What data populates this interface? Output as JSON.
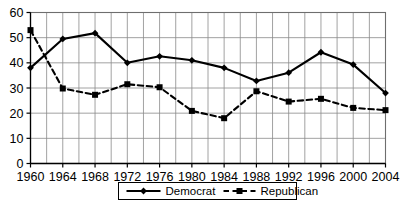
{
  "chart_data": {
    "type": "line",
    "title": "",
    "subtitle": "",
    "xlabel": "",
    "ylabel": "",
    "categories": [
      "1960",
      "1964",
      "1968",
      "1972",
      "1976",
      "1980",
      "1984",
      "1988",
      "1992",
      "1996",
      "2000",
      "2004"
    ],
    "x": [
      1960,
      1964,
      1968,
      1972,
      1976,
      1980,
      1984,
      1988,
      1992,
      1996,
      2000,
      2004
    ],
    "xlim": [
      1960,
      2004
    ],
    "ylim": [
      0,
      60
    ],
    "ytick_labels": [
      "60",
      "50",
      "40",
      "30",
      "20",
      "10",
      "0"
    ],
    "ytick_values": [
      60,
      50,
      40,
      30,
      20,
      10,
      0
    ],
    "xtick_labels": [
      "1960",
      "1964",
      "1968",
      "1972",
      "1976",
      "1980",
      "1984",
      "1988",
      "1992",
      "1996",
      "2000",
      "2004"
    ],
    "grid": true,
    "grid_x_step": 2,
    "grid_y_step": 10,
    "legend_position": "bottom",
    "series": [
      {
        "name": "Democrat",
        "marker": "diamond",
        "line_style": "solid",
        "color": "#000000",
        "values": [
          38,
          49.5,
          51.8,
          40,
          42.6,
          41,
          38,
          32.8,
          36.1,
          44.2,
          39.3,
          28
        ]
      },
      {
        "name": "Republican",
        "marker": "square",
        "line_style": "dashed",
        "color": "#000000",
        "values": [
          53,
          29.8,
          27.3,
          31.5,
          30.3,
          20.9,
          18,
          28.7,
          24.6,
          25.7,
          22.1,
          21.2
        ]
      }
    ]
  },
  "legend": {
    "entries": [
      {
        "label": "Democrat"
      },
      {
        "label": "Republican"
      }
    ]
  },
  "axes": {
    "y_axis_name": "percent-axis",
    "x_axis_name": "year-axis"
  }
}
